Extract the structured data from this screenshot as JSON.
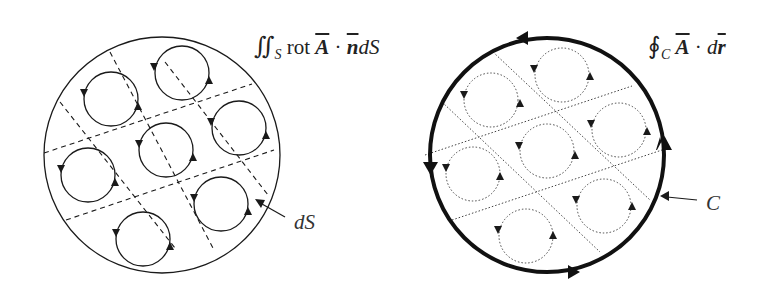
{
  "figure": {
    "left_panel": {
      "formula": {
        "symbol": "∬",
        "subscript": "S",
        "operator": "rot",
        "vector_a": "A",
        "dot": "·",
        "vector_n": "n",
        "differential": "dS"
      },
      "pointer_label": "dS",
      "boundary_style": "thin solid",
      "grid_style": "dashed",
      "loop_count": 7
    },
    "right_panel": {
      "formula": {
        "symbol": "∮",
        "subscript": "C",
        "vector_a": "A",
        "dot": "·",
        "differential_d": "d",
        "vector_r": "r"
      },
      "pointer_label": "C",
      "boundary_style": "thick solid with arrows",
      "grid_style": "dotted",
      "loop_count": 7
    },
    "colors": {
      "ink": "#1a1a1a",
      "background": "#ffffff"
    }
  }
}
